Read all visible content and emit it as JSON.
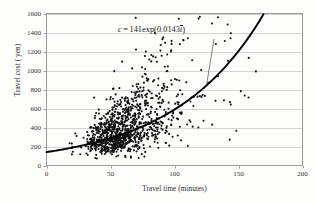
{
  "chart_data": {
    "type": "scatter",
    "title": "",
    "xlabel": "Travel time (minutes)",
    "ylabel": "Travel cost ( yen)",
    "xlim": [
      0,
      200
    ],
    "ylim": [
      0,
      1600
    ],
    "xticks": [
      0,
      50,
      100,
      150,
      200
    ],
    "yticks": [
      0,
      200,
      400,
      600,
      800,
      1000,
      1200,
      1400,
      1600
    ],
    "grid": "horizontal",
    "legend": "none",
    "annotations": [
      {
        "name": "fitted-curve-equation",
        "text": "c = 141exp(0.0143t̄)",
        "parts": {
          "lhs": "c",
          "equals": "=",
          "coefficient": "141",
          "fn": "exp",
          "open_paren": "(",
          "rate": "0.0143",
          "variable": "t̄",
          "close_paren": ")"
        },
        "leader_line": true
      }
    ],
    "series": [
      {
        "name": "Observed travel time vs travel cost",
        "type": "scatter",
        "marker": "filled-circle",
        "color": "#111111",
        "n_points": 1100,
        "description": "Dense positively-skewed cloud rising from about (20, 150) to (170, 1450); bulk of points between 40 and 120 minutes and 200 to 800 yen, with spread widening as travel time increases."
      },
      {
        "name": "Fitted exponential curve",
        "type": "line",
        "color": "#000000",
        "equation": "c = 141*exp(0.0143*t)",
        "coefficient": 141,
        "rate": 0.0143,
        "x_range": [
          0,
          170
        ],
        "description": "Smooth exponential trend line through the scatter, starting near 141 yen at 0 minutes and reaching about 1590 yen at 170 minutes."
      }
    ]
  }
}
